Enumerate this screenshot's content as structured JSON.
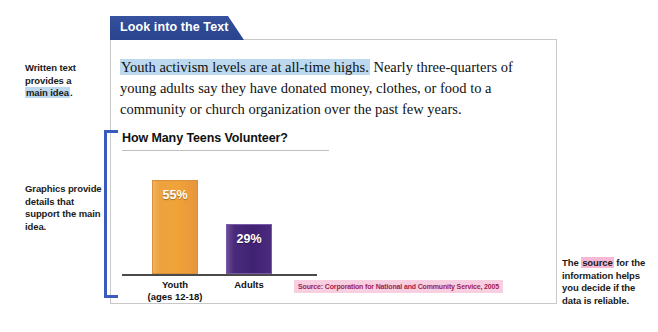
{
  "tab": {
    "label": "Look into the Text"
  },
  "annotations": {
    "written_text": {
      "line1": "Written text",
      "line2": "provides a",
      "highlight": "main idea",
      "line3_tail": "."
    },
    "graphics": {
      "text": "Graphics provide details that support the main idea."
    },
    "source": {
      "pre": "The",
      "highlight": "source",
      "post": "for the information helps you decide if the data is reliable."
    }
  },
  "body": {
    "highlighted_sentence": "Youth activism levels are at all-time highs.",
    "rest": " Nearly three-quarters of young adults say they have donated money, clothes, or food to a community or church organization over the past few years."
  },
  "chart_data": {
    "type": "bar",
    "title": "How Many Teens Volunteer?",
    "categories": [
      "Youth (ages 12-18)",
      "Adults"
    ],
    "values": [
      55,
      29
    ],
    "value_labels": [
      "55%",
      "29%"
    ],
    "xlabel": "",
    "ylabel": "",
    "ylim": [
      0,
      70
    ],
    "grid": false,
    "legend": "none",
    "source": "Source: Corporation for National and Community Service, 2005",
    "category_labels": [
      {
        "line1": "Youth",
        "line2": "(ages 12-18)"
      },
      {
        "line1": "Adults",
        "line2": ""
      }
    ],
    "colors": {
      "youth_bar": "#f0a338",
      "adults_bar": "#3f2273",
      "bracket": "#3b5bbf",
      "tab": "#2e4a95",
      "highlight_blue": "#bcd9ef",
      "highlight_pink": "#f6b8d4",
      "source_text": "#a32050",
      "source_background": "#f7cfe0"
    }
  }
}
